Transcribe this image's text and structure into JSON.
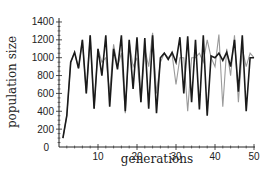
{
  "chart_data": {
    "type": "line",
    "title": "",
    "xlabel": "generations",
    "ylabel": "population size",
    "xlim": [
      0,
      50
    ],
    "ylim": [
      0,
      1450
    ],
    "xticks": [
      10,
      20,
      30,
      40,
      50
    ],
    "yticks": [
      0,
      200,
      400,
      600,
      800,
      1000,
      1200,
      1400
    ],
    "x_origin_label": "0",
    "grid": false,
    "legend": null,
    "x": [
      1,
      2,
      3,
      4,
      5,
      6,
      7,
      8,
      9,
      10,
      11,
      12,
      13,
      14,
      15,
      16,
      17,
      18,
      19,
      20,
      21,
      22,
      23,
      24,
      25,
      26,
      27,
      28,
      29,
      30,
      31,
      32,
      33,
      34,
      35,
      36,
      37,
      38,
      39,
      40,
      41,
      42,
      43,
      44,
      45,
      46,
      47,
      48,
      49,
      50
    ],
    "series": [
      {
        "name": "series-dark",
        "color": "#1a1a1a",
        "values": [
          100,
          350,
          950,
          1060,
          880,
          1200,
          600,
          1250,
          430,
          1100,
          800,
          1250,
          450,
          1100,
          870,
          1250,
          400,
          1200,
          650,
          1230,
          500,
          1220,
          430,
          1250,
          380,
          1000,
          1050,
          980,
          1060,
          950,
          1230,
          600,
          1240,
          500,
          1200,
          420,
          1250,
          350,
          1020,
          1000,
          1050,
          970,
          1060,
          900,
          1200,
          620,
          1250,
          400,
          1000,
          1000
        ]
      },
      {
        "name": "series-light",
        "color": "#9a9a9a",
        "values": [
          100,
          350,
          950,
          1060,
          880,
          1200,
          600,
          1250,
          430,
          1100,
          950,
          1000,
          600,
          1150,
          900,
          1050,
          380,
          1180,
          900,
          1000,
          500,
          1100,
          900,
          1280,
          600,
          950,
          1050,
          1000,
          1040,
          700,
          1000,
          1000,
          400,
          1000,
          1000,
          1050,
          950,
          1200,
          1000,
          900,
          1260,
          450,
          1100,
          800,
          1250,
          500,
          1100,
          900,
          1050,
          1000
        ]
      }
    ]
  },
  "axes": {
    "y_tick_labels": [
      "0",
      "200",
      "400",
      "600",
      "800",
      "1000",
      "1200",
      "1400"
    ],
    "x_tick_labels": [
      "10",
      "20",
      "30",
      "40",
      "50"
    ],
    "x_origin_label": "0",
    "xlabel": "generations",
    "ylabel": "population size"
  }
}
